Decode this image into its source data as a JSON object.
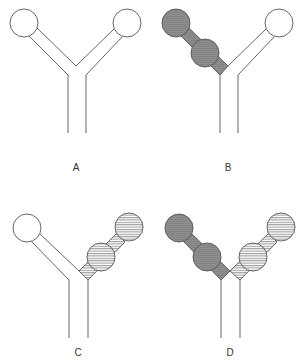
{
  "figure": {
    "colors": {
      "outline": "#555555",
      "dark_fill": "#8c8c8c",
      "hatch_line": "#6a6a6a",
      "empty_fill": "#ffffff"
    },
    "panels": [
      {
        "id": "A",
        "label": "A",
        "left_arm": "empty",
        "right_arm": "empty"
      },
      {
        "id": "B",
        "label": "B",
        "left_arm": "dark-filled with two spheres",
        "right_arm": "empty"
      },
      {
        "id": "C",
        "label": "C",
        "left_arm": "empty",
        "right_arm": "horizontal-hatched with two spheres"
      },
      {
        "id": "D",
        "label": "D",
        "left_arm": "dark-filled with two spheres",
        "right_arm": "horizontal-hatched with two spheres"
      }
    ]
  }
}
